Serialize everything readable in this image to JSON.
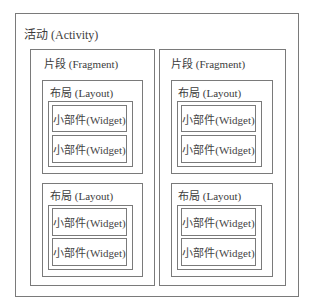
{
  "activity": {
    "label": "活动 (Activity)",
    "fragments": [
      {
        "label": "片段 (Fragment)",
        "layouts": [
          {
            "label": "布局 (Layout)",
            "widgets": [
              "小部件(Widget)",
              "小部件(Widget)"
            ]
          },
          {
            "label": "布局 (Layout)",
            "widgets": [
              "小部件(Widget)",
              "小部件(Widget)"
            ]
          }
        ]
      },
      {
        "label": "片段 (Fragment)",
        "layouts": [
          {
            "label": "布局 (Layout)",
            "widgets": [
              "小部件(Widget)",
              "小部件(Widget)"
            ]
          },
          {
            "label": "布局 (Layout)",
            "widgets": [
              "小部件(Widget)",
              "小部件(Widget)"
            ]
          }
        ]
      }
    ]
  },
  "colors": {
    "border": "#7a7a7a",
    "text": "#3c3c3c",
    "background": "#ffffff"
  }
}
